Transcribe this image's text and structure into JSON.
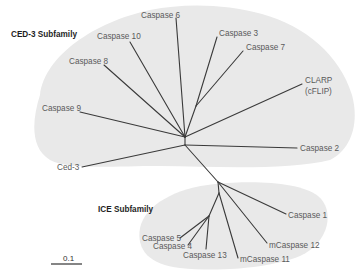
{
  "diagram": {
    "type": "unrooted phylogenetic tree",
    "groups": [
      {
        "id": "ced3",
        "label": "CED-3 Subfamily",
        "color": "#e9e9e9"
      },
      {
        "id": "ice",
        "label": "ICE Subfamily",
        "color": "#e9e9e9"
      }
    ],
    "leaves": {
      "caspase6": "Caspase 6",
      "caspase10": "Caspase 10",
      "caspase8": "Caspase 8",
      "caspase9": "Caspase 9",
      "caspase3": "Caspase 3",
      "caspase7": "Caspase 7",
      "clarp_line1": "CLARP",
      "clarp_line2": "(cFLIP)",
      "caspase2": "Caspase 2",
      "ced3": "Ced-3",
      "caspase1": "Caspase 1",
      "mcaspase12": "mCaspase 12",
      "mcaspase11": "mCaspase 11",
      "caspase13": "Caspase 13",
      "caspase5": "Caspase 5",
      "caspase4": "Caspase 4"
    },
    "scale_bar": {
      "label": "0.1"
    },
    "colors": {
      "branch": "#3a3a3a",
      "leaf_text": "#5a5a5a",
      "group_text": "#1e1e1e",
      "shading": "#e9e9e9"
    }
  }
}
